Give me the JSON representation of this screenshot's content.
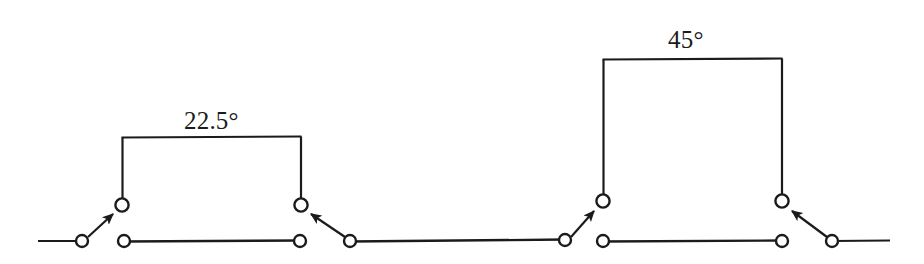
{
  "figure": {
    "name": "stepped-switch-contact-diagram",
    "background_color": "#ffffff",
    "ink_color": "#1b1b1b",
    "width": 924,
    "height": 264,
    "baseline_y": 241,
    "labels": [
      {
        "id": "left",
        "text": "22.5°",
        "x": 184,
        "y": 108
      },
      {
        "id": "right",
        "text": "45°",
        "x": 668,
        "y": 27
      }
    ],
    "steps": [
      {
        "id": "step-22-5",
        "label": "22.5°",
        "left_x": 122,
        "right_x": 301,
        "top_y": 137,
        "contact_y": 205
      },
      {
        "id": "step-45",
        "label": "45°",
        "left_x": 603,
        "right_x": 782,
        "top_y": 59,
        "contact_y": 201
      }
    ],
    "baseline_segments": [
      {
        "id": "lead-in-left",
        "x1": 38,
        "y1": 241,
        "x2": 82,
        "y2": 241
      },
      {
        "id": "lower-rail-1",
        "x1": 124,
        "y1": 241,
        "x2": 300,
        "y2": 241
      },
      {
        "id": "mid-rail",
        "x1": 350,
        "y1": 241,
        "x2": 565,
        "y2": 241
      },
      {
        "id": "lower-rail-2",
        "x1": 603,
        "y1": 241,
        "x2": 782,
        "y2": 241
      },
      {
        "id": "lead-out-right",
        "x1": 832,
        "y1": 241,
        "x2": 890,
        "y2": 241
      }
    ],
    "contacts": [
      {
        "id": "contact-lower-1",
        "x": 82,
        "y": 241,
        "r": 6
      },
      {
        "id": "contact-lower-2",
        "x": 124,
        "y": 241,
        "r": 6
      },
      {
        "id": "contact-lower-3",
        "x": 300,
        "y": 241,
        "r": 6
      },
      {
        "id": "contact-lower-4",
        "x": 350,
        "y": 241,
        "r": 6
      },
      {
        "id": "contact-lower-5",
        "x": 565,
        "y": 241,
        "r": 6
      },
      {
        "id": "contact-lower-6",
        "x": 603,
        "y": 241,
        "r": 6
      },
      {
        "id": "contact-lower-7",
        "x": 782,
        "y": 241,
        "r": 6
      },
      {
        "id": "contact-lower-8",
        "x": 832,
        "y": 241,
        "r": 6
      },
      {
        "id": "contact-raised-1",
        "x": 122,
        "y": 205,
        "r": 7
      },
      {
        "id": "contact-raised-2",
        "x": 301,
        "y": 205,
        "r": 7
      },
      {
        "id": "contact-raised-3",
        "x": 603,
        "y": 201,
        "r": 7
      },
      {
        "id": "contact-raised-4",
        "x": 782,
        "y": 201,
        "r": 7
      }
    ],
    "arrows": [
      {
        "id": "arrow-up-right-1",
        "from_x": 82,
        "from_y": 241,
        "to_x": 114,
        "to_y": 212,
        "direction": "up-right"
      },
      {
        "id": "arrow-up-left-1",
        "from_x": 350,
        "from_y": 241,
        "to_x": 310,
        "to_y": 212,
        "direction": "up-left"
      },
      {
        "id": "arrow-up-right-2",
        "from_x": 565,
        "from_y": 241,
        "to_x": 595,
        "to_y": 209,
        "direction": "up-right"
      },
      {
        "id": "arrow-up-left-2",
        "from_x": 832,
        "from_y": 241,
        "to_x": 791,
        "to_y": 209,
        "direction": "up-left"
      }
    ]
  }
}
